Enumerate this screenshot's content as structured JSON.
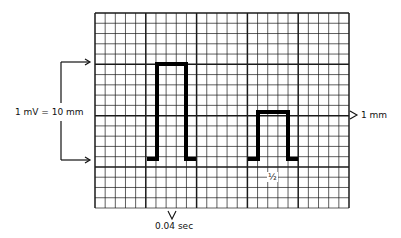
{
  "diagram": {
    "grid": {
      "left": 95,
      "top": 13,
      "right": 349,
      "bottom": 208,
      "small_square_px": 10.16,
      "major_every": 5,
      "line_color": "#1a1a1a"
    },
    "pulses": [
      {
        "name": "full-standard-pulse",
        "x_start": 157,
        "x_end": 186,
        "top": 64,
        "baseline": 159
      },
      {
        "name": "half-standard-pulse",
        "x_start": 258,
        "x_end": 288,
        "top": 112,
        "baseline": 159
      }
    ],
    "labels": {
      "amplitude": "1 mV = 10 mm",
      "small_box": "1 mm",
      "half_standard": "½",
      "time": "0.04 sec"
    },
    "bracket": {
      "x": 61,
      "y_top": 62,
      "y_bottom": 160,
      "arrow_x": 90
    }
  }
}
